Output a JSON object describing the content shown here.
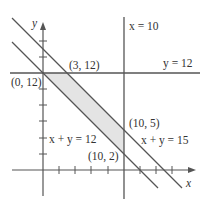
{
  "diagram": {
    "type": "linear-inequality-feasible-region",
    "axes": {
      "x_label": "x",
      "y_label": "y",
      "tick_spacing_units": 2,
      "x_ticks": [
        2,
        4,
        6,
        8,
        10,
        12,
        14,
        16
      ],
      "y_ticks": [
        2,
        4,
        6,
        8,
        10,
        12,
        14,
        16
      ]
    },
    "lines": [
      {
        "id": "x10",
        "label": "x = 10",
        "equation": "x = 10"
      },
      {
        "id": "y12",
        "label": "y = 12",
        "equation": "y = 12"
      },
      {
        "id": "xy12",
        "label": "x + y = 12",
        "equation": "x + y = 12"
      },
      {
        "id": "xy15",
        "label": "x + y = 15",
        "equation": "x + y = 15"
      }
    ],
    "vertices": [
      {
        "label": "(0, 12)",
        "x": 0,
        "y": 12
      },
      {
        "label": "(3, 12)",
        "x": 3,
        "y": 12
      },
      {
        "label": "(10, 5)",
        "x": 10,
        "y": 5
      },
      {
        "label": "(10, 2)",
        "x": 10,
        "y": 2
      }
    ],
    "region_fill": "#e6e6e6",
    "line_color": "#555555"
  }
}
